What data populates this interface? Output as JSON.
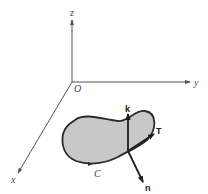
{
  "diagram": {
    "type": "3d-coordinate-surface-diagram",
    "colors": {
      "axis": "#555555",
      "region_fill": "#c8c8c8",
      "region_outline": "#2a2a2a",
      "vector": "#1e1e1e",
      "label": "#444444"
    },
    "axes": {
      "origin_label": "O",
      "z_label": "z",
      "y_label": "y",
      "x_label": "x"
    },
    "curve": {
      "label": "C"
    },
    "vectors": {
      "k_label": "k",
      "T_label": "T",
      "n_label": "n"
    }
  }
}
